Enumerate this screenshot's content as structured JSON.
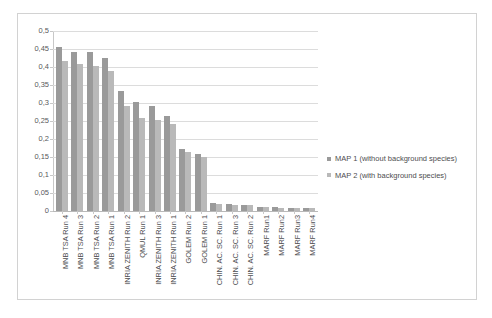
{
  "chart_data": {
    "type": "bar",
    "title": "",
    "subtitle": "",
    "xlabel": "",
    "ylabel": "",
    "ylim": [
      0,
      0.5
    ],
    "ytick_step": 0.05,
    "decimal_separator": ",",
    "grid": true,
    "legend_position": "right",
    "ytick_labels": [
      "0",
      "0,05",
      "0,1",
      "0,15",
      "0,2",
      "0,25",
      "0,3",
      "0,35",
      "0,4",
      "0,45",
      "0,5"
    ],
    "ytick_values": [
      0,
      0.05,
      0.1,
      0.15,
      0.2,
      0.25,
      0.3,
      0.35,
      0.4,
      0.45,
      0.5
    ],
    "categories": [
      "MNB TSA Run 4",
      "MNB TSA Run 3",
      "MNB TSA Run 2",
      "MNB TSA Run 1",
      "INRIA ZENITH Run 2",
      "QMUL Run 1",
      "INRIA ZENITH Run 3",
      "INRIA ZENITH Run 1",
      "GOLEM Run 2",
      "GOLEM Run 1",
      "CHIN. AC. SC. Run 1",
      "CHIN. AC. SC. Run 3",
      "CHIN. AC. SC. Run 2",
      "MARF Run1",
      "MARF Run2",
      "MARF Run3",
      "MARF Run4"
    ],
    "series": [
      {
        "name": "MAP 1 (without background species)",
        "color": "#9a9a9a",
        "values": [
          0.455,
          0.443,
          0.442,
          0.424,
          0.333,
          0.303,
          0.291,
          0.264,
          0.172,
          0.158,
          0.021,
          0.02,
          0.018,
          0.011,
          0.01,
          0.009,
          0.008
        ]
      },
      {
        "name": "MAP 2 (with background species)",
        "color": "#b9b9b9",
        "values": [
          0.416,
          0.409,
          0.404,
          0.389,
          0.292,
          0.259,
          0.254,
          0.241,
          0.165,
          0.15,
          0.019,
          0.018,
          0.016,
          0.01,
          0.009,
          0.008,
          0.007
        ]
      }
    ]
  },
  "legend": {
    "items": [
      {
        "label": "MAP 1 (without background species)",
        "swatch": "map1"
      },
      {
        "label": "MAP 2 (with background species)",
        "swatch": "map2"
      }
    ]
  },
  "colors": {
    "map1": "#9a9a9a",
    "map2": "#b9b9b9",
    "gridline": "#dcdcdc",
    "frame": "#d2d2d2",
    "text": "#4d4d4f",
    "plot_background": "#ffffff"
  }
}
